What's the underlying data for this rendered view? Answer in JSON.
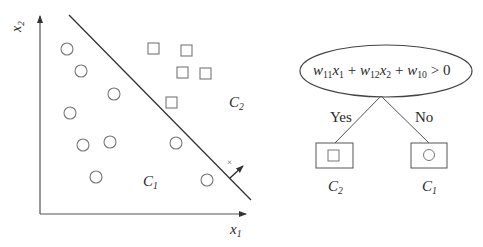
{
  "scatter": {
    "x_axis_label": "x",
    "x_axis_sub": "1",
    "y_axis_label": "x",
    "y_axis_sub": "2",
    "region_c1": {
      "label": "C",
      "sub": "1"
    },
    "region_c2": {
      "label": "C",
      "sub": "2"
    },
    "normal_marker": "×",
    "circles": [
      [
        67,
        49
      ],
      [
        81,
        71
      ],
      [
        114,
        94
      ],
      [
        70,
        113
      ],
      [
        83,
        145
      ],
      [
        110,
        142
      ],
      [
        96,
        177
      ],
      [
        176,
        143
      ],
      [
        207,
        180
      ]
    ],
    "squares": [
      [
        154,
        49
      ],
      [
        187,
        51
      ],
      [
        183,
        72
      ],
      [
        206,
        74
      ],
      [
        172,
        102
      ]
    ],
    "decision_line": [
      [
        69,
        15
      ],
      [
        251,
        200
      ]
    ]
  },
  "tree": {
    "condition": {
      "w11": "w",
      "w11_sub": "11",
      "x1": "x",
      "x1_sub": "1",
      "w12": "w",
      "w12_sub": "12",
      "x2": "x",
      "x2_sub": "2",
      "w10": "w",
      "w10_sub": "10",
      "plus": "+",
      "gt": "> 0"
    },
    "yes_label": "Yes",
    "no_label": "No",
    "left_leaf": {
      "class": "C",
      "sub": "2",
      "symbol": "square"
    },
    "right_leaf": {
      "class": "C",
      "sub": "1",
      "symbol": "circle"
    }
  }
}
